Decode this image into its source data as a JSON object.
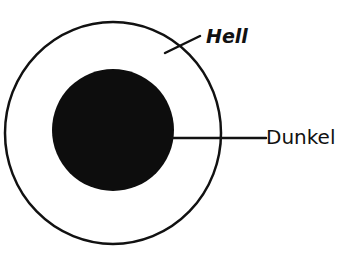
{
  "diagram": {
    "type": "concentric-circles",
    "colors": {
      "stroke": "#111111",
      "fill_dark": "#0d0d0d",
      "background": "#ffffff"
    },
    "outer_circle": {
      "label": "Hell",
      "cx": 113,
      "cy": 133,
      "rx": 108,
      "ry": 111
    },
    "inner_circle": {
      "label": "Dunkel",
      "cx": 113,
      "cy": 130,
      "r": 61,
      "filled": true
    }
  },
  "labels": {
    "hell": "Hell",
    "dunkel": "Dunkel"
  }
}
